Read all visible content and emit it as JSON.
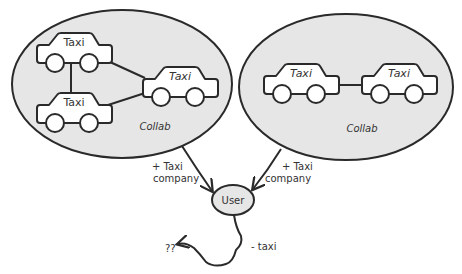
{
  "diagram": {
    "groups": [
      {
        "id": "collab-left",
        "label": "Collab",
        "taxis": [
          {
            "label": "Taxi"
          },
          {
            "label": "Taxi"
          },
          {
            "label": "Taxi"
          }
        ]
      },
      {
        "id": "collab-right",
        "label": "Collab",
        "taxis": [
          {
            "label": "Taxi"
          },
          {
            "label": "Taxi"
          }
        ]
      }
    ],
    "user": {
      "label": "User"
    },
    "edges": [
      {
        "from": "collab-left",
        "to": "user",
        "label_line1": "+ Taxi",
        "label_line2": "company"
      },
      {
        "from": "collab-right",
        "to": "user",
        "label_line1": "+ Taxi",
        "label_line2": "company"
      },
      {
        "from": "user",
        "to": "unknown",
        "label": "- taxi",
        "target_label": "??"
      }
    ],
    "colors": {
      "ellipse_fill": "#e6e6e6",
      "stroke": "#2a2a2a",
      "car_fill": "#ffffff"
    }
  }
}
